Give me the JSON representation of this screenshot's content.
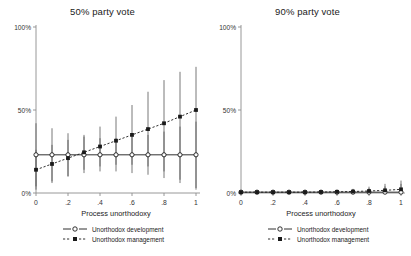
{
  "figure": {
    "background": "#ffffff",
    "axis_color": "#8c8c8c",
    "series_color": "#1a1a1a"
  },
  "panels": [
    {
      "id": "left",
      "title": "50% party vote",
      "xlabel": "Process unorthodoxy"
    },
    {
      "id": "right",
      "title": "90% party vote",
      "xlabel": "Process unorthodoxy"
    }
  ],
  "legend": {
    "items": [
      {
        "label": "Unorthodox development",
        "marker": "open-circle",
        "line": "solid"
      },
      {
        "label": "Unorthodox management",
        "marker": "filled-square",
        "line": "dashed"
      }
    ]
  },
  "chart_data": [
    {
      "type": "line",
      "title": "50% party vote",
      "xlabel": "Process unorthodoxy",
      "ylabel": "",
      "xlim": [
        0,
        1
      ],
      "ylim": [
        0,
        1
      ],
      "xticks": [
        0,
        0.2,
        0.4,
        0.6,
        0.8,
        1
      ],
      "xticklabels": [
        "0",
        ".2",
        ".4",
        ".6",
        ".8",
        "1"
      ],
      "yticks": [
        0,
        0.5,
        1
      ],
      "yticklabels": [
        "0%",
        "50%",
        "100%"
      ],
      "grid": false,
      "legend_position": "below",
      "x": [
        0,
        0.1,
        0.2,
        0.3,
        0.4,
        0.5,
        0.6,
        0.7,
        0.8,
        0.9,
        1
      ],
      "series": [
        {
          "name": "Unorthodox development",
          "marker": "open-circle",
          "line": "solid",
          "values": [
            0.23,
            0.23,
            0.23,
            0.23,
            0.23,
            0.23,
            0.23,
            0.23,
            0.23,
            0.23,
            0.23
          ],
          "ci_low": [
            0.04,
            0.07,
            0.1,
            0.12,
            0.13,
            0.13,
            0.12,
            0.11,
            0.09,
            0.06,
            0.03
          ],
          "ci_high": [
            0.42,
            0.39,
            0.36,
            0.34,
            0.33,
            0.33,
            0.34,
            0.35,
            0.37,
            0.4,
            0.43
          ]
        },
        {
          "name": "Unorthodox management",
          "marker": "filled-square",
          "line": "dashed",
          "values": [
            0.14,
            0.175,
            0.21,
            0.245,
            0.28,
            0.315,
            0.35,
            0.385,
            0.42,
            0.46,
            0.5
          ],
          "ci_low": [
            0.02,
            0.06,
            0.1,
            0.14,
            0.16,
            0.17,
            0.17,
            0.16,
            0.13,
            0.08,
            0.02
          ],
          "ci_high": [
            0.26,
            0.29,
            0.32,
            0.35,
            0.4,
            0.46,
            0.53,
            0.61,
            0.68,
            0.73,
            0.76
          ]
        }
      ]
    },
    {
      "type": "line",
      "title": "90% party vote",
      "xlabel": "Process unorthodoxy",
      "ylabel": "",
      "xlim": [
        0,
        1
      ],
      "ylim": [
        0,
        1
      ],
      "xticks": [
        0,
        0.2,
        0.4,
        0.6,
        0.8,
        1
      ],
      "xticklabels": [
        "0",
        ".2",
        ".4",
        ".6",
        ".8",
        "1"
      ],
      "yticks": [
        0,
        0.5,
        1
      ],
      "yticklabels": [
        "0%",
        "50%",
        "100%"
      ],
      "grid": false,
      "legend_position": "below",
      "x": [
        0,
        0.1,
        0.2,
        0.3,
        0.4,
        0.5,
        0.6,
        0.7,
        0.8,
        0.9,
        1
      ],
      "series": [
        {
          "name": "Unorthodox development",
          "marker": "open-circle",
          "line": "solid",
          "values": [
            0.005,
            0.005,
            0.005,
            0.005,
            0.005,
            0.005,
            0.005,
            0.005,
            0.005,
            0.005,
            0.005
          ],
          "ci_low": [
            0.0,
            0.0,
            0.0,
            0.0,
            0.0,
            0.0,
            0.0,
            0.0,
            0.0,
            0.0,
            0.0
          ],
          "ci_high": [
            0.012,
            0.012,
            0.012,
            0.012,
            0.013,
            0.014,
            0.016,
            0.02,
            0.028,
            0.04,
            0.055
          ]
        },
        {
          "name": "Unorthodox management",
          "marker": "filled-square",
          "line": "dashed",
          "values": [
            0.005,
            0.005,
            0.005,
            0.005,
            0.005,
            0.006,
            0.007,
            0.009,
            0.012,
            0.016,
            0.022
          ],
          "ci_low": [
            0.0,
            0.0,
            0.0,
            0.0,
            0.0,
            0.0,
            0.0,
            0.0,
            0.0,
            0.0,
            0.0
          ],
          "ci_high": [
            0.012,
            0.012,
            0.012,
            0.012,
            0.013,
            0.015,
            0.018,
            0.025,
            0.038,
            0.055,
            0.075
          ]
        }
      ]
    }
  ]
}
